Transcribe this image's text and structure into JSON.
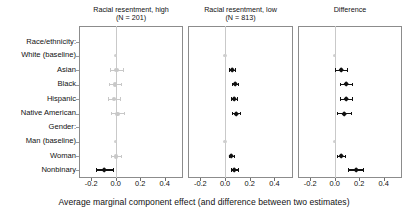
{
  "figure": {
    "axis_title": "Average marginal component effect (and difference between two estimates)",
    "xlabel": "Average marginal component effect (and difference between two estimates)",
    "row_groups": [
      "Race/ethnicity:",
      "Gender:"
    ],
    "row_labels": [
      "Race/ethnicity:",
      "White (baseline)",
      "Asian",
      "Black",
      "Hispanic",
      "Native American",
      "Gender:",
      "Man (baseline)",
      "Woman",
      "Nonbinary"
    ],
    "tick_labels": [
      "-0.2",
      "0.0",
      "0.2",
      "0.4"
    ],
    "colors": {
      "significant": "#111111",
      "nonsignificant": "#c8c8c8",
      "baseline": "#cfcfcf",
      "zero_line": "#c9c9c9",
      "frame": "#8c8c8c"
    }
  },
  "chart_data": {
    "type": "scatter",
    "title": "",
    "xlabel": "Average marginal component effect (and difference between two estimates)",
    "ylabel": "",
    "xlim": [
      -0.3,
      0.55
    ],
    "xticks": [
      -0.2,
      0.0,
      0.2,
      0.4
    ],
    "grid": false,
    "legend": "none",
    "categories": [
      "Race/ethnicity:",
      "White (baseline)",
      "Asian",
      "Black",
      "Hispanic",
      "Native American",
      "Gender:",
      "Man (baseline)",
      "Woman",
      "Nonbinary"
    ],
    "panels": [
      {
        "name": "panel-racial-resentment-high",
        "title": "Racial resentment, high",
        "subtitle": "(N = 201)",
        "n": 201,
        "points": [
          {
            "label": "White (baseline)",
            "estimate": 0.0,
            "ci_low": 0.0,
            "ci_high": 0.0,
            "baseline": true,
            "significant": false
          },
          {
            "label": "Asian",
            "estimate": 0.005,
            "ci_low": -0.05,
            "ci_high": 0.06,
            "baseline": false,
            "significant": false
          },
          {
            "label": "Black",
            "estimate": -0.005,
            "ci_low": -0.055,
            "ci_high": 0.045,
            "baseline": false,
            "significant": false
          },
          {
            "label": "Hispanic",
            "estimate": -0.015,
            "ci_low": -0.065,
            "ci_high": 0.035,
            "baseline": false,
            "significant": false
          },
          {
            "label": "Native American",
            "estimate": 0.015,
            "ci_low": -0.04,
            "ci_high": 0.07,
            "baseline": false,
            "significant": false
          },
          {
            "label": "Man (baseline)",
            "estimate": 0.0,
            "ci_low": 0.0,
            "ci_high": 0.0,
            "baseline": true,
            "significant": false
          },
          {
            "label": "Woman",
            "estimate": 0.0,
            "ci_low": -0.04,
            "ci_high": 0.04,
            "baseline": false,
            "significant": false
          },
          {
            "label": "Nonbinary",
            "estimate": -0.095,
            "ci_low": -0.165,
            "ci_high": -0.025,
            "baseline": false,
            "significant": true
          }
        ]
      },
      {
        "name": "panel-racial-resentment-low",
        "title": "Racial resentment, low",
        "subtitle": "(N = 813)",
        "n": 813,
        "points": [
          {
            "label": "White (baseline)",
            "estimate": 0.0,
            "ci_low": 0.0,
            "ci_high": 0.0,
            "baseline": true,
            "significant": false
          },
          {
            "label": "Asian",
            "estimate": 0.055,
            "ci_low": 0.03,
            "ci_high": 0.08,
            "baseline": false,
            "significant": true
          },
          {
            "label": "Black",
            "estimate": 0.08,
            "ci_low": 0.055,
            "ci_high": 0.105,
            "baseline": false,
            "significant": true
          },
          {
            "label": "Hispanic",
            "estimate": 0.075,
            "ci_low": 0.05,
            "ci_high": 0.1,
            "baseline": false,
            "significant": true
          },
          {
            "label": "Native American",
            "estimate": 0.09,
            "ci_low": 0.06,
            "ci_high": 0.12,
            "baseline": false,
            "significant": true
          },
          {
            "label": "Man (baseline)",
            "estimate": 0.0,
            "ci_low": 0.0,
            "ci_high": 0.0,
            "baseline": true,
            "significant": false
          },
          {
            "label": "Woman",
            "estimate": 0.05,
            "ci_low": 0.03,
            "ci_high": 0.07,
            "baseline": false,
            "significant": true
          },
          {
            "label": "Nonbinary",
            "estimate": 0.075,
            "ci_low": 0.045,
            "ci_high": 0.105,
            "baseline": false,
            "significant": true
          }
        ]
      },
      {
        "name": "panel-difference",
        "title": "Difference",
        "subtitle": "",
        "points": [
          {
            "label": "White (baseline)",
            "estimate": 0.0,
            "ci_low": 0.0,
            "ci_high": 0.0,
            "baseline": true,
            "significant": false
          },
          {
            "label": "Asian",
            "estimate": 0.05,
            "ci_low": 0.0,
            "ci_high": 0.1,
            "baseline": false,
            "significant": true
          },
          {
            "label": "Black",
            "estimate": 0.09,
            "ci_low": 0.04,
            "ci_high": 0.145,
            "baseline": false,
            "significant": true
          },
          {
            "label": "Hispanic",
            "estimate": 0.09,
            "ci_low": 0.04,
            "ci_high": 0.145,
            "baseline": false,
            "significant": true
          },
          {
            "label": "Native American",
            "estimate": 0.075,
            "ci_low": 0.02,
            "ci_high": 0.13,
            "baseline": false,
            "significant": true
          },
          {
            "label": "Man (baseline)",
            "estimate": 0.0,
            "ci_low": 0.0,
            "ci_high": 0.0,
            "baseline": true,
            "significant": false
          },
          {
            "label": "Woman",
            "estimate": 0.05,
            "ci_low": 0.015,
            "ci_high": 0.085,
            "baseline": false,
            "significant": true
          },
          {
            "label": "Nonbinary",
            "estimate": 0.175,
            "ci_low": 0.11,
            "ci_high": 0.235,
            "baseline": false,
            "significant": true
          }
        ]
      }
    ]
  }
}
